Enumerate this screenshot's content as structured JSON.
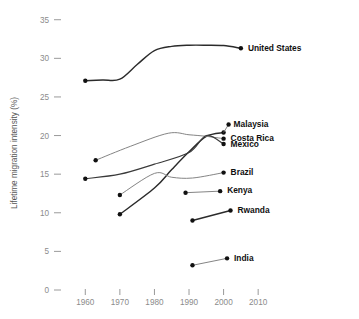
{
  "chart_data": {
    "type": "line",
    "title": "",
    "xlabel": "",
    "ylabel": "Lifetime migration intensity (%)",
    "xlim": [
      1955,
      2014
    ],
    "ylim": [
      0,
      36
    ],
    "xticks": [
      1960,
      1970,
      1980,
      1990,
      2000,
      2010
    ],
    "xtick_labels": [
      "1960",
      "1970",
      "1980",
      "1990",
      "2000",
      "2010"
    ],
    "yticks": [
      0,
      5,
      10,
      15,
      20,
      25,
      30,
      35
    ],
    "ytick_labels": [
      "0",
      "5",
      "10",
      "15",
      "20",
      "25",
      "30",
      "35"
    ],
    "grid": false,
    "legend": "right-inline-labels",
    "series": [
      {
        "name": "United States",
        "label": "United States",
        "style": "bold",
        "points": [
          [
            1960,
            27.1
          ],
          [
            1965,
            27.2
          ],
          [
            1970,
            27.3
          ],
          [
            1975,
            29.2
          ],
          [
            1980,
            31.0
          ],
          [
            1985,
            31.55
          ],
          [
            1990,
            31.7
          ],
          [
            1995,
            31.7
          ],
          [
            2000,
            31.65
          ],
          [
            2005,
            31.3
          ]
        ],
        "marker_points": [
          [
            1960,
            27.1
          ],
          [
            2005,
            31.3
          ]
        ],
        "label_anchor": [
          2005,
          31.3
        ]
      },
      {
        "name": "Malaysia",
        "label": "Malaysia",
        "style": "bold",
        "points": [
          [
            1970,
            9.8
          ],
          [
            1980,
            13.2
          ],
          [
            1985,
            15.6
          ],
          [
            1990,
            17.9
          ],
          [
            1995,
            19.9
          ],
          [
            2000,
            20.4
          ]
        ],
        "marker_points": [
          [
            1970,
            9.8
          ],
          [
            2000,
            20.4
          ]
        ],
        "label_anchor": [
          2000,
          20.4
        ]
      },
      {
        "name": "Costa Rica",
        "label": "Costa Rica",
        "style": "thin",
        "points": [
          [
            1963,
            16.8
          ],
          [
            1973,
            18.6
          ],
          [
            1984,
            20.3
          ],
          [
            1990,
            20.1
          ],
          [
            1995,
            19.9
          ],
          [
            2000,
            19.6
          ]
        ],
        "marker_points": [
          [
            1963,
            16.8
          ],
          [
            2000,
            19.6
          ]
        ],
        "label_anchor": [
          2000,
          19.6
        ]
      },
      {
        "name": "Mexico",
        "label": "Mexico",
        "style": "normal",
        "points": [
          [
            1960,
            14.4
          ],
          [
            1970,
            15.0
          ],
          [
            1980,
            16.3
          ],
          [
            1990,
            17.8
          ],
          [
            1995,
            20.0
          ],
          [
            2000,
            18.9
          ]
        ],
        "marker_points": [
          [
            1960,
            14.4
          ],
          [
            2000,
            18.9
          ]
        ],
        "label_anchor": [
          2000,
          18.9
        ]
      },
      {
        "name": "Brazil",
        "label": "Brazil",
        "style": "thin",
        "points": [
          [
            1970,
            12.3
          ],
          [
            1980,
            15.1
          ],
          [
            1985,
            14.6
          ],
          [
            1991,
            14.5
          ],
          [
            2000,
            15.2
          ]
        ],
        "marker_points": [
          [
            1970,
            12.3
          ],
          [
            2000,
            15.2
          ]
        ],
        "label_anchor": [
          2000,
          15.2
        ]
      },
      {
        "name": "Kenya",
        "label": "Kenya",
        "style": "thin",
        "points": [
          [
            1989,
            12.6
          ],
          [
            1999,
            12.8
          ]
        ],
        "marker_points": [
          [
            1989,
            12.6
          ],
          [
            1999,
            12.8
          ]
        ],
        "label_anchor": [
          1999,
          12.8
        ]
      },
      {
        "name": "Rwanda",
        "label": "Rwanda",
        "style": "bold",
        "points": [
          [
            1991,
            9.0
          ],
          [
            2002,
            10.3
          ]
        ],
        "marker_points": [
          [
            1991,
            9.0
          ],
          [
            2002,
            10.3
          ]
        ],
        "label_anchor": [
          2002,
          10.3
        ]
      },
      {
        "name": "India",
        "label": "India",
        "style": "thin",
        "points": [
          [
            1991,
            3.2
          ],
          [
            2001,
            4.1
          ]
        ],
        "marker_points": [
          [
            1991,
            3.2
          ],
          [
            2001,
            4.1
          ]
        ],
        "label_anchor": [
          2001,
          4.1
        ]
      }
    ],
    "annotations": [
      {
        "name": "label-united-states",
        "text": "United States",
        "at": [
          2005,
          31.3
        ],
        "offset_px": [
          7,
          0
        ]
      },
      {
        "name": "label-malaysia",
        "text": "Malaysia",
        "at": [
          2000,
          20.4
        ],
        "offset_px": [
          7,
          -8
        ]
      },
      {
        "name": "label-costa-rica",
        "text": "Costa Rica",
        "at": [
          2000,
          19.6
        ],
        "offset_px": [
          7,
          0
        ]
      },
      {
        "name": "label-mexico",
        "text": "Mexico",
        "at": [
          2000,
          18.9
        ],
        "offset_px": [
          7,
          1
        ]
      },
      {
        "name": "label-brazil",
        "text": "Brazil",
        "at": [
          2000,
          15.2
        ],
        "offset_px": [
          7,
          0
        ]
      },
      {
        "name": "label-kenya",
        "text": "Kenya",
        "at": [
          1999,
          12.8
        ],
        "offset_px": [
          7,
          0
        ]
      },
      {
        "name": "label-rwanda",
        "text": "Rwanda",
        "at": [
          2002,
          10.3
        ],
        "offset_px": [
          7,
          0
        ]
      },
      {
        "name": "label-india",
        "text": "India",
        "at": [
          2001,
          4.1
        ],
        "offset_px": [
          7,
          0
        ]
      }
    ],
    "colors": {
      "line": "#3a3a3a",
      "line_thin": "#7d7d7d",
      "line_bold": "#2b2b2b",
      "marker": "#111111",
      "tick_text": "#8b8b8b",
      "axis_title": "#555555",
      "background": "#ffffff"
    }
  }
}
